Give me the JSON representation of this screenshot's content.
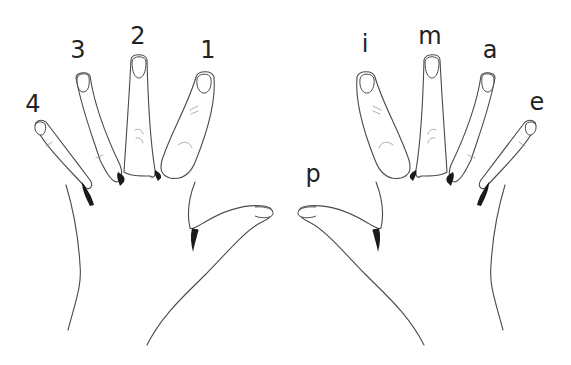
{
  "figure": {
    "left_hand": {
      "description": "Left hand (fretting) finger numbers",
      "labels": [
        {
          "finger": "pinky",
          "label": "4"
        },
        {
          "finger": "ring",
          "label": "3"
        },
        {
          "finger": "middle",
          "label": "2"
        },
        {
          "finger": "index",
          "label": "1"
        }
      ]
    },
    "right_hand": {
      "description": "Right hand (plucking) finger letters",
      "labels": [
        {
          "finger": "thumb",
          "label": "p"
        },
        {
          "finger": "index",
          "label": "i"
        },
        {
          "finger": "middle",
          "label": "m"
        },
        {
          "finger": "ring",
          "label": "a"
        },
        {
          "finger": "pinky",
          "label": "e"
        }
      ]
    },
    "colors": {
      "background": "#ffffff",
      "line": "#4a4a4a",
      "label": "#222222",
      "shadow": "#1a1a1a"
    }
  }
}
